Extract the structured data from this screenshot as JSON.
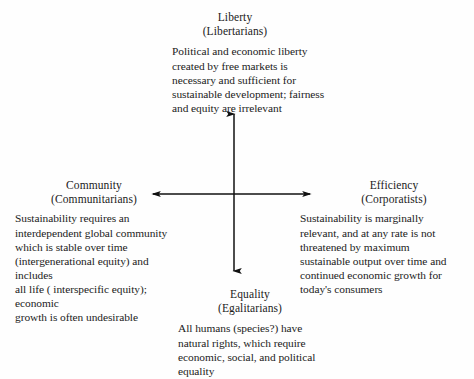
{
  "figure": {
    "background_color": "#fefefe",
    "text_color": "#1b1b1b",
    "axis_color": "#101010"
  },
  "axes": {
    "vertical": {
      "name": "vertical-axis",
      "x": 234,
      "top_y": 113,
      "bottom_y": 272,
      "arrowheads": "both"
    },
    "horizontal": {
      "name": "horizontal-axis",
      "y": 194,
      "left_x": 152,
      "right_x": 311,
      "arrowheads": "both"
    },
    "origin": {
      "x": 234,
      "y": 194
    }
  },
  "quadrants": {
    "top": {
      "position": "top",
      "heading": "Liberty",
      "subheading": "(Libertarians)",
      "text": "Political and economic liberty\ncreated by free markets is\nnecessary and sufficient for\nsustainable development; fairness\nand equity are irrelevant"
    },
    "left": {
      "position": "left",
      "heading": "Community",
      "subheading": "(Communitarians)",
      "text": "Sustainability requires an\ninterdependent global community\nwhich is stable over time\n(intergenerational equity) and includes\nall life ( interspecific equity); economic\ngrowth is often undesirable"
    },
    "right": {
      "position": "right",
      "heading": "Efficiency",
      "subheading": "(Corporatists)",
      "text": "Sustainability is marginally\nrelevant, and at any rate is not\nthreatened by maximum\nsustainable output over time and\ncontinued economic growth for\ntoday's consumers"
    },
    "bottom": {
      "position": "bottom",
      "heading": "Equality",
      "subheading": "(Egalitarians)",
      "text": "All humans (species?) have\nnatural rights, which require\neconomic, social, and political\nequality"
    }
  }
}
